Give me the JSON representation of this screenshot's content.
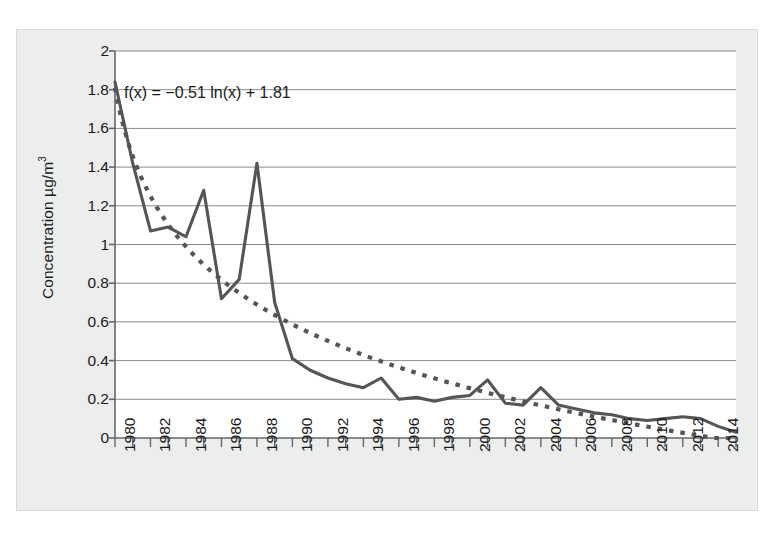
{
  "chart_data": {
    "type": "line",
    "title": "",
    "xlabel": "",
    "ylabel": "Concentration µg/m³",
    "ylabel_text": "Concentration µg/m",
    "ylabel_exponent": "3",
    "xlim": [
      1980,
      2015
    ],
    "ylim": [
      0,
      2
    ],
    "ytick_values": [
      0,
      0.2,
      0.4,
      0.6,
      0.8,
      1,
      1.2,
      1.4,
      1.6,
      1.8,
      2
    ],
    "ytick_labels": [
      "0",
      "0.2",
      "0.4",
      "0.6",
      "0.8",
      "1",
      "1.2",
      "1.4",
      "1.6",
      "1.8",
      "2"
    ],
    "xtick_labels": [
      "1980",
      "1982",
      "1984",
      "1986",
      "1988",
      "1990",
      "1992",
      "1994",
      "1996",
      "1998",
      "2000",
      "2002",
      "2004",
      "2006",
      "2008",
      "2010",
      "2012",
      "2014"
    ],
    "xtick_values": [
      1980,
      1982,
      1984,
      1986,
      1988,
      1990,
      1992,
      1994,
      1996,
      1998,
      2000,
      2002,
      2004,
      2006,
      2008,
      2010,
      2012,
      2014
    ],
    "x_minor_step": 1,
    "grid": "horizontal",
    "legend": "none",
    "annotation": "f(x) = −0.51 ln(x) + 1.81",
    "fit": {
      "label": "logarithmic trendline",
      "style": "dotted",
      "color": "#555555",
      "a": -0.51,
      "b": 1.81,
      "formula": "f(x) = -0.51*ln(x_index) + 1.81"
    },
    "series": [
      {
        "name": "Concentration",
        "style": "solid",
        "color": "#555555",
        "x": [
          1980,
          1981,
          1982,
          1983,
          1984,
          1985,
          1986,
          1987,
          1988,
          1989,
          1990,
          1991,
          1992,
          1993,
          1994,
          1995,
          1996,
          1997,
          1998,
          1999,
          2000,
          2001,
          2002,
          2003,
          2004,
          2005,
          2006,
          2007,
          2008,
          2009,
          2010,
          2011,
          2012,
          2013,
          2014,
          2015
        ],
        "values": [
          1.84,
          1.42,
          1.07,
          1.09,
          1.04,
          1.28,
          0.72,
          0.82,
          1.42,
          0.7,
          0.41,
          0.35,
          0.31,
          0.28,
          0.26,
          0.31,
          0.2,
          0.21,
          0.19,
          0.21,
          0.22,
          0.3,
          0.18,
          0.17,
          0.26,
          0.17,
          0.15,
          0.13,
          0.12,
          0.1,
          0.09,
          0.1,
          0.11,
          0.1,
          0.06,
          0.03
        ]
      }
    ]
  },
  "figure": {
    "background_color": "#eceded",
    "plot_background_color": "#ffffff",
    "grid_color": "#8a8a8a",
    "axis_color": "#666666",
    "text_color": "#1a1a1a"
  }
}
